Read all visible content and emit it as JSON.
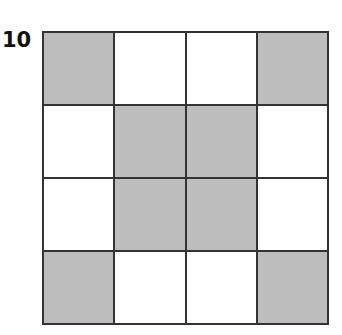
{
  "figure": {
    "label": "10",
    "rows": 4,
    "cols": 4,
    "pattern": [
      [
        1,
        0,
        0,
        1
      ],
      [
        0,
        1,
        1,
        0
      ],
      [
        0,
        1,
        1,
        0
      ],
      [
        1,
        0,
        0,
        1
      ]
    ],
    "colors": {
      "shaded": "#bdbdbd",
      "unshaded": "#ffffff",
      "line": "#333333"
    }
  }
}
